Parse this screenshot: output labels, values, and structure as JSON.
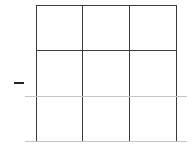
{
  "board": {
    "rows": 3,
    "cols": 3,
    "cells": [
      [
        "",
        "",
        ""
      ],
      [
        "",
        "",
        ""
      ],
      [
        "",
        "",
        ""
      ]
    ]
  },
  "indicator": {
    "symbol": "—",
    "icon": "dash-icon"
  },
  "colors": {
    "grid_dark": "#3a3a3a",
    "grid_light": "#c4c4c4",
    "background": "#ffffff"
  }
}
